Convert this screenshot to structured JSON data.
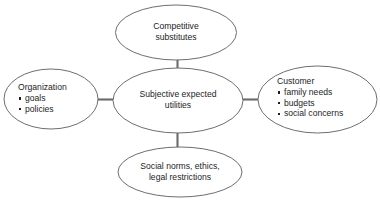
{
  "diagram": {
    "background_color": "#ffffff",
    "node_stroke_color": "#6e6e6e",
    "connector_color": "#6b6b6b",
    "text_color": "#1d1d1d",
    "nodes": {
      "center": {
        "id": "subjective-expected-utilities",
        "line1": "Subjective expected",
        "line2": "utilities"
      },
      "top": {
        "id": "competitive-substitutes",
        "line1": "Competitive",
        "line2": "substitutes"
      },
      "bottom": {
        "id": "social-norms",
        "line1": "Social norms, ethics,",
        "line2": "legal restrictions"
      },
      "left": {
        "id": "organization",
        "heading": "Organization",
        "items": [
          "goals",
          "policies"
        ]
      },
      "right": {
        "id": "customer",
        "heading": "Customer",
        "items": [
          "family needs",
          "budgets",
          "social concerns"
        ]
      }
    },
    "connectors": [
      {
        "id": "center-to-top",
        "from": "center",
        "to": "top"
      },
      {
        "id": "center-to-bottom",
        "from": "center",
        "to": "bottom"
      },
      {
        "id": "center-to-left",
        "from": "center",
        "to": "left"
      },
      {
        "id": "center-to-right",
        "from": "center",
        "to": "right"
      }
    ]
  }
}
